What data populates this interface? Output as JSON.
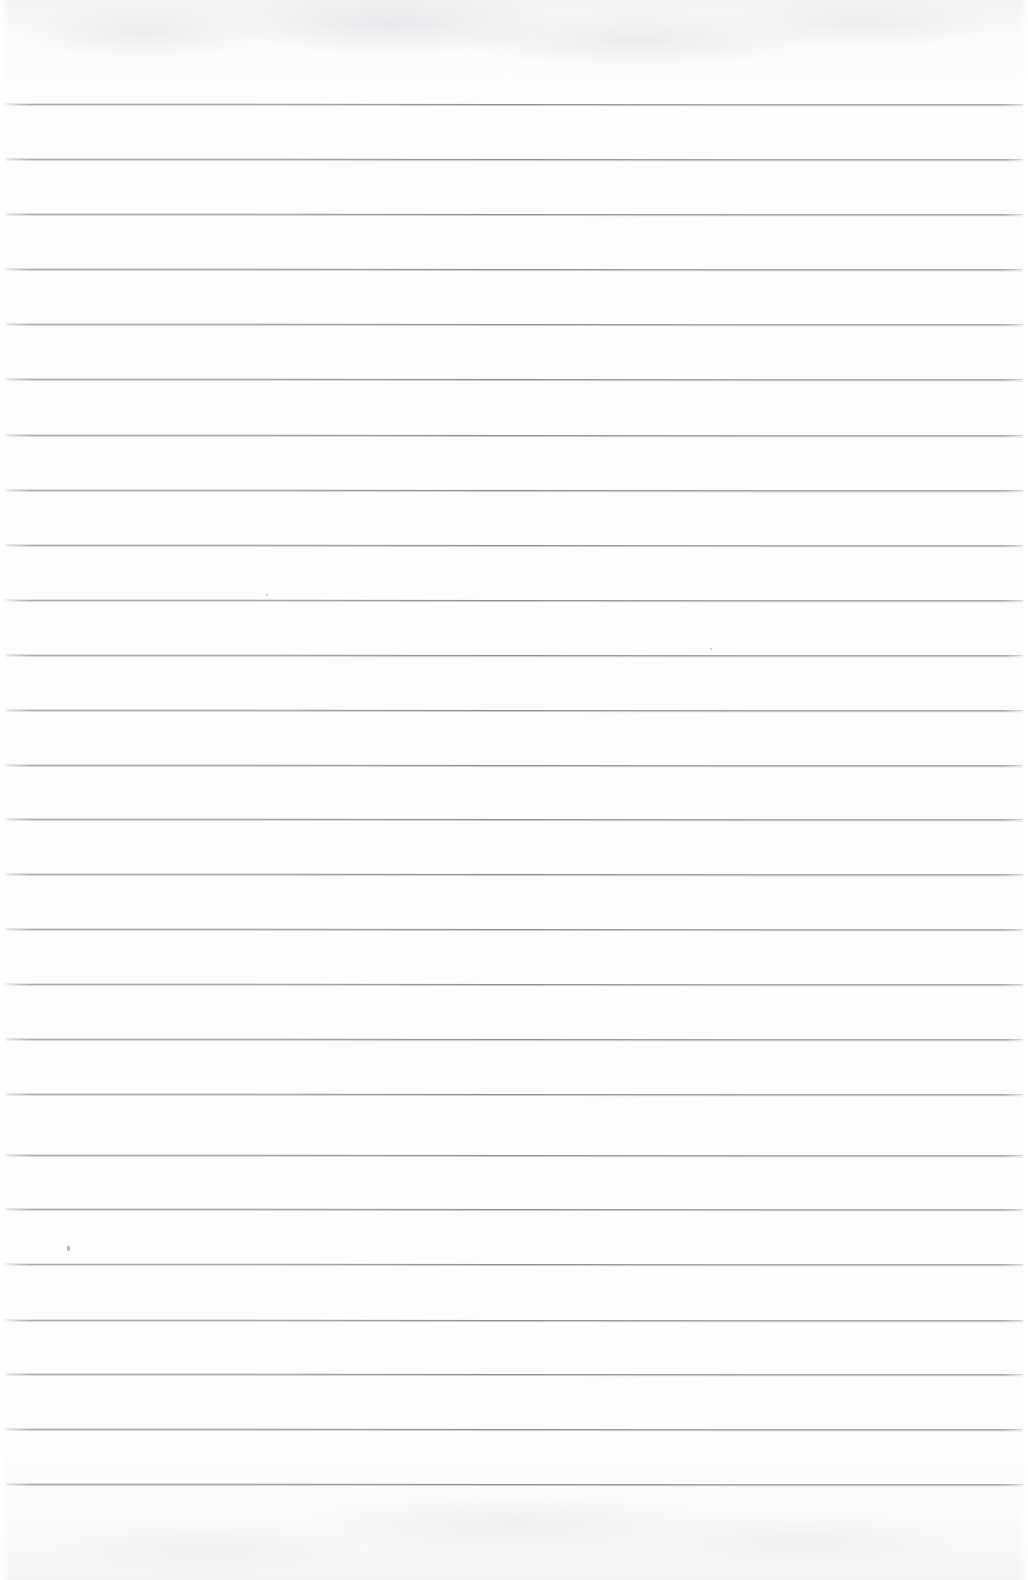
{
  "document": {
    "kind": "scanned-lined-notebook-page",
    "title": "Blank ruled notebook page",
    "orientation": "portrait",
    "width_px": 1028,
    "height_px": 1580,
    "text_content": "",
    "handwriting_present": false,
    "page_number": "",
    "header_text": "",
    "footer_text": ""
  },
  "paper": {
    "background_color": "#fdfdfd",
    "top_edge_shade_color": "#f4f4f6",
    "bottom_edge_shade_color": "#f6f6f8",
    "texture": "faint scan grain with mottled bands at top and bottom edges"
  },
  "ruling": {
    "line_color": "#8d8d93",
    "line_thickness_px": 1,
    "line_spacing_px": 55,
    "first_line_y_px": 104,
    "line_left_x_px": 5,
    "line_right_x_px": 1023,
    "line_count": 26,
    "margin_rule_present": false,
    "line_y_positions": [
      104,
      159,
      214,
      269,
      324,
      379,
      435,
      490,
      545,
      600,
      655,
      710,
      765,
      819,
      874,
      929,
      984,
      1039,
      1094,
      1155,
      1209,
      1264,
      1320,
      1374,
      1429,
      1484
    ]
  },
  "blemishes": [
    {
      "name": "ink-speck",
      "x": 67,
      "y": 1246,
      "w": 3,
      "h": 5
    },
    {
      "name": "dust-fleck",
      "x": 710,
      "y": 648,
      "w": 2,
      "h": 2
    },
    {
      "name": "dust-fleck",
      "x": 266,
      "y": 594,
      "w": 2,
      "h": 2
    }
  ]
}
